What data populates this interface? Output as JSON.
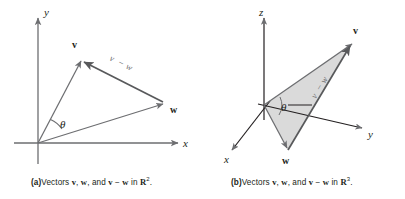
{
  "figure": {
    "background_color": "#ffffff",
    "stroke_color": "#6d6e71",
    "text_color": "#231f20",
    "triangle_fill": "#d4d4d4"
  },
  "panel_a": {
    "id": "a",
    "caption_tag": "(a)",
    "caption_text_1": "Vectors ",
    "caption_v": "v",
    "caption_sep_1": ", ",
    "caption_w": "w",
    "caption_sep_2": ", and ",
    "caption_v2": "v",
    "caption_minus": " − ",
    "caption_w2": "w",
    "caption_in": " in ",
    "caption_space": "R",
    "caption_dim": "2",
    "caption_period": ".",
    "caption_full": "(a) Vectors v, w, and v − w in R2.",
    "axes": [
      {
        "name": "x-axis",
        "label": "x"
      },
      {
        "name": "y-axis",
        "label": "y"
      }
    ],
    "vectors": [
      {
        "name": "v",
        "label": "v"
      },
      {
        "name": "w",
        "label": "w"
      },
      {
        "name": "v-minus-w",
        "label_v": "v",
        "label_minus": "−",
        "label_w": "w"
      }
    ],
    "angle": {
      "name": "theta",
      "label": "θ"
    }
  },
  "panel_b": {
    "id": "b",
    "caption_tag": "(b)",
    "caption_text_1": "Vectors ",
    "caption_v": "v",
    "caption_sep_1": ", ",
    "caption_w": "w",
    "caption_sep_2": ", and ",
    "caption_v2": "v",
    "caption_minus": " − ",
    "caption_w2": "w",
    "caption_in": " in ",
    "caption_space": "R",
    "caption_dim": "3",
    "caption_period": ".",
    "caption_full": "(b) Vectors v, w, and v − w in R3.",
    "axes": [
      {
        "name": "x-axis",
        "label": "x"
      },
      {
        "name": "y-axis",
        "label": "y"
      },
      {
        "name": "z-axis",
        "label": "z"
      }
    ],
    "vectors": [
      {
        "name": "v",
        "label": "v"
      },
      {
        "name": "w",
        "label": "w"
      },
      {
        "name": "v-minus-w",
        "label_v": "v",
        "label_minus": "−",
        "label_w": "w"
      }
    ],
    "angle": {
      "name": "theta",
      "label": "θ"
    }
  }
}
